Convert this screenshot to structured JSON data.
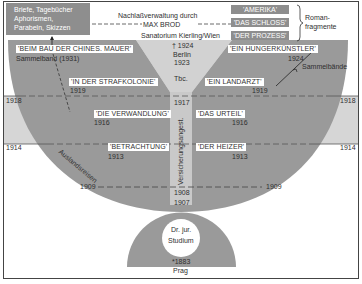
{
  "colors": {
    "dark_gray": "#9a9a9a",
    "light_gray": "#d6d6d6",
    "stem_gray": "#c9c9c9",
    "box_gray": "#8e8e8e",
    "frame": "#444444"
  },
  "top_box": {
    "lines": [
      "Briefe, Tagebücher",
      "Aphorismen,",
      "Parabeln, Skizzen"
    ]
  },
  "estate": {
    "line1": "Nachlaßverwaltung durch",
    "line2": "MAX BROD"
  },
  "novel_fragments": {
    "titles": [
      "'AMERIKA'",
      "'DAS SCHLOSS'",
      "'DER PROZESS'"
    ],
    "label_line1": "Roman-",
    "label_line2": "fragmente"
  },
  "center": {
    "sanatorium": "Sanatorium Kierling/Wien",
    "death": "† 1924",
    "berlin": "Berlin",
    "berlin_year": "1923",
    "tbc": "Tbc.",
    "year_1917": "1917",
    "insurance": "Versicherungsangest.",
    "year_1908": "1908",
    "year_1907": "1907"
  },
  "works_left": [
    {
      "title": "'BEIM BAU DER CHINES. MAUER'",
      "year": "Sammelband (1931)"
    },
    {
      "title": "'IN DER STRAFKOLONIE'",
      "year": "1919"
    },
    {
      "title": "'DIE VERWANDLUNG'",
      "year": "1916"
    },
    {
      "title": "'BETRACHTUNG'",
      "year": "1913"
    }
  ],
  "works_right": [
    {
      "title": "'EIN HUNGERKÜNSTLER'",
      "year": "1924"
    },
    {
      "title": "'EIN LANDARZT'",
      "year": "1919"
    },
    {
      "title": "'DAS URTEIL'",
      "year": "1916"
    },
    {
      "title": "'DER HEIZER'",
      "year": "1913"
    }
  ],
  "collections_label": "Sammelbände",
  "travel_label": "Auslandsreisen",
  "timeline": {
    "y1918_left": "1918",
    "y1918_right": "1918",
    "y1914_left": "1914",
    "y1914_right": "1914",
    "y1909_left": "1909",
    "y1909_right": "1909"
  },
  "origin": {
    "study_line1": "Dr. jur.",
    "study_line2": "Studium",
    "birth": "*1883",
    "city": "Prag"
  }
}
